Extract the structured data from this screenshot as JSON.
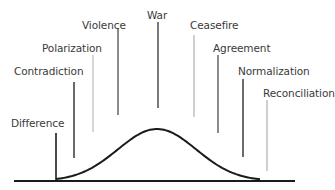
{
  "diagram": {
    "title": "",
    "stages": [
      {
        "label": "Difference",
        "x": 56,
        "label_left": 11,
        "label_top": 117,
        "line_top": 133,
        "line_bottom": 182,
        "color": "#4a4a4a"
      },
      {
        "label": "Contradiction",
        "x": 74,
        "label_left": 14,
        "label_top": 65,
        "line_top": 82,
        "line_bottom": 158,
        "color": "#6a6a6a"
      },
      {
        "label": "Polarization",
        "x": 93,
        "label_left": 42,
        "label_top": 42,
        "line_top": 55,
        "line_bottom": 132,
        "color": "#d6d6d6"
      },
      {
        "label": "Violence",
        "x": 118,
        "label_left": 82,
        "label_top": 19,
        "line_top": 28,
        "line_bottom": 115,
        "color": "#8a8a8a"
      },
      {
        "label": "War",
        "x": 158,
        "label_left": 147,
        "label_top": 9,
        "line_top": 22,
        "line_bottom": 108,
        "color": "#7a7a7a"
      },
      {
        "label": "Ceasefire",
        "x": 194,
        "label_left": 190,
        "label_top": 19,
        "line_top": 35,
        "line_bottom": 117,
        "color": "#cfcfcf"
      },
      {
        "label": "Agreement",
        "x": 218,
        "label_left": 213,
        "label_top": 42,
        "line_top": 55,
        "line_bottom": 133,
        "color": "#8a8a8a"
      },
      {
        "label": "Normalization",
        "x": 243,
        "label_left": 238,
        "label_top": 65,
        "line_top": 79,
        "line_bottom": 157,
        "color": "#6a6a6a"
      },
      {
        "label": "Reconciliation",
        "x": 267,
        "label_left": 263,
        "label_top": 87,
        "line_top": 100,
        "line_bottom": 171,
        "color": "#cfcfcf"
      }
    ],
    "baseline": {
      "x1": 14,
      "x2": 295,
      "y": 181,
      "color": "#1a1a1a"
    },
    "curve": {
      "start_x": 56,
      "peak_x": 157,
      "peak_y": 129,
      "end_x": 260,
      "base_y": 181,
      "color": "#1a1a1a"
    }
  }
}
